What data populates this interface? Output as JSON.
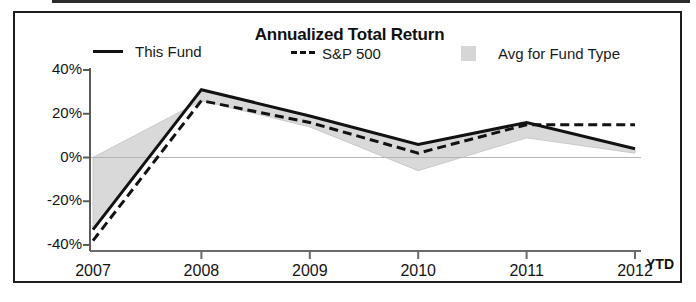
{
  "chart_data": {
    "type": "line",
    "title": "Annualized Total Return",
    "xlabel": "",
    "ylabel": "",
    "grid": false,
    "legend_position": "top",
    "categories": [
      "2007",
      "2008",
      "2009",
      "2010",
      "2011",
      "2012"
    ],
    "x_axis_suffix_label": "YTD",
    "x_tick_labels": [
      "2007",
      "2008",
      "2009",
      "2010",
      "2011",
      "2012"
    ],
    "y_tick_labels": [
      "40%",
      "20%",
      "0%",
      "-20%",
      "-40%"
    ],
    "y_tick_values": [
      40,
      20,
      0,
      -20,
      -40
    ],
    "ylim": [
      -40,
      40
    ],
    "series": [
      {
        "name": "This Fund",
        "style": "solid",
        "color": "#121212",
        "values": [
          -33,
          31,
          19,
          6,
          16,
          4
        ]
      },
      {
        "name": "S&P 500",
        "style": "dashed",
        "color": "#121212",
        "values": [
          -38,
          26,
          16,
          2,
          15,
          15
        ]
      },
      {
        "name": "Avg for Fund Type",
        "style": "filled-area",
        "color": "#d9d9d9",
        "values": [
          0,
          26,
          14,
          -6,
          9,
          2
        ]
      }
    ]
  },
  "title": "Annualized Total Return",
  "legend": {
    "fund_label": "This Fund",
    "sp_label": "S&P 500",
    "avg_label": "Avg for Fund Type",
    "fund_swatch": "solid-line-swatch",
    "sp_swatch": "dashed-line-swatch",
    "avg_swatch": "gray-box-swatch"
  },
  "axes": {
    "y_ticks": [
      "40%",
      "20%",
      "0%",
      "-20%",
      "-40%"
    ],
    "x_ticks": [
      "2007",
      "2008",
      "2009",
      "2010",
      "2011",
      "2012"
    ],
    "ytd": "YTD"
  },
  "colors": {
    "line": "#121212",
    "area": "#d9d9d9",
    "frame": "#1d1d1d",
    "background": "#ffffff"
  }
}
